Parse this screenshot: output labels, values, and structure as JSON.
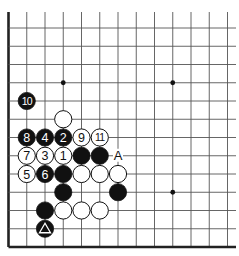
{
  "diagram": {
    "type": "go-board-fragment",
    "visible_cols": 13,
    "visible_rows": 13,
    "edges": {
      "left": true,
      "bottom": true,
      "top": false,
      "right": false
    },
    "star_points": [
      [
        3,
        3
      ],
      [
        9,
        3
      ],
      [
        9,
        9
      ]
    ],
    "colors": {
      "black": "#111111",
      "white": "#ffffff",
      "line": "#555555",
      "edge": "#222222"
    },
    "stones": [
      {
        "color": "black",
        "col": 1,
        "row": 4,
        "label": "10"
      },
      {
        "color": "white",
        "col": 3,
        "row": 5,
        "label": ""
      },
      {
        "color": "black",
        "col": 1,
        "row": 6,
        "label": "8"
      },
      {
        "color": "black",
        "col": 2,
        "row": 6,
        "label": "4"
      },
      {
        "color": "black",
        "col": 3,
        "row": 6,
        "label": "2"
      },
      {
        "color": "white",
        "col": 4,
        "row": 6,
        "label": "9"
      },
      {
        "color": "white",
        "col": 5,
        "row": 6,
        "label": "11"
      },
      {
        "color": "white",
        "col": 1,
        "row": 7,
        "label": "7"
      },
      {
        "color": "white",
        "col": 2,
        "row": 7,
        "label": "3"
      },
      {
        "color": "white",
        "col": 3,
        "row": 7,
        "label": "1"
      },
      {
        "color": "black",
        "col": 4,
        "row": 7,
        "label": ""
      },
      {
        "color": "black",
        "col": 5,
        "row": 7,
        "label": ""
      },
      {
        "color": "white",
        "col": 1,
        "row": 8,
        "label": "5"
      },
      {
        "color": "black",
        "col": 2,
        "row": 8,
        "label": "6"
      },
      {
        "color": "black",
        "col": 3,
        "row": 8,
        "label": ""
      },
      {
        "color": "white",
        "col": 4,
        "row": 8,
        "label": ""
      },
      {
        "color": "white",
        "col": 5,
        "row": 8,
        "label": ""
      },
      {
        "color": "white",
        "col": 6,
        "row": 8,
        "label": ""
      },
      {
        "color": "black",
        "col": 3,
        "row": 9,
        "label": ""
      },
      {
        "color": "black",
        "col": 6,
        "row": 9,
        "label": ""
      },
      {
        "color": "black",
        "col": 2,
        "row": 10,
        "label": ""
      },
      {
        "color": "white",
        "col": 3,
        "row": 10,
        "label": ""
      },
      {
        "color": "white",
        "col": 4,
        "row": 10,
        "label": ""
      },
      {
        "color": "white",
        "col": 5,
        "row": 10,
        "label": ""
      },
      {
        "color": "black",
        "col": 2,
        "row": 11,
        "label": "",
        "marker": "triangle"
      }
    ],
    "point_labels": [
      {
        "col": 6,
        "row": 7,
        "text": "A"
      }
    ]
  }
}
